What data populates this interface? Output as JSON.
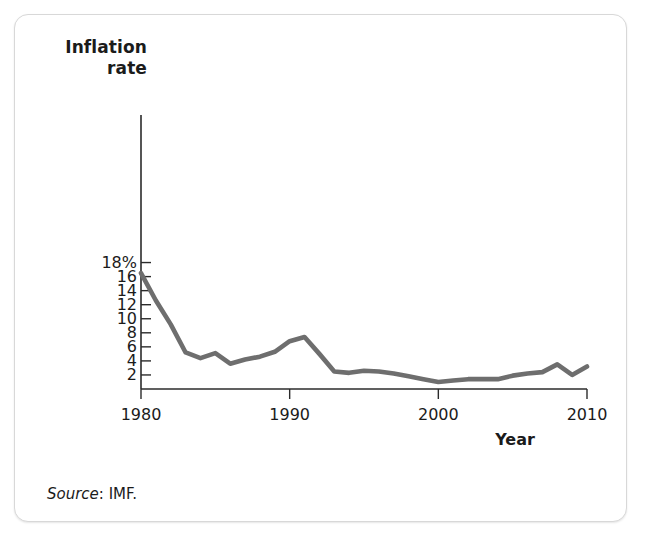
{
  "figure": {
    "source_label": "Source",
    "source_separator": ": ",
    "source_value": "IMF."
  },
  "chart_data": {
    "type": "line",
    "title": "",
    "ylabel_line1": "Inflation",
    "ylabel_line2": "rate",
    "xlabel": "Year",
    "xlim": [
      1980,
      2010
    ],
    "ylim": [
      0,
      18
    ],
    "grid": false,
    "legend": "none",
    "line_color": "#6e6e6e",
    "axis_color": "#2b2b2b",
    "y_ticks": [
      2,
      4,
      6,
      8,
      10,
      12,
      14,
      16,
      18
    ],
    "y_tick_labels": [
      "2",
      "4",
      "6",
      "8",
      "10",
      "12",
      "14",
      "16",
      "18%"
    ],
    "x_ticks": [
      1980,
      1990,
      2000,
      2010
    ],
    "x_tick_labels": [
      "1980",
      "1990",
      "2000",
      "2010"
    ],
    "series": [
      {
        "name": "Inflation rate",
        "x": [
          1980,
          1981,
          1982,
          1983,
          1984,
          1985,
          1986,
          1987,
          1988,
          1989,
          1990,
          1991,
          1992,
          1993,
          1994,
          1995,
          1996,
          1997,
          1998,
          1999,
          2000,
          2001,
          2002,
          2003,
          2004,
          2005,
          2006,
          2007,
          2008,
          2009,
          2010
        ],
        "y": [
          16.5,
          12.6,
          9.2,
          5.2,
          4.4,
          5.1,
          3.6,
          4.2,
          4.6,
          5.3,
          6.8,
          7.4,
          5.0,
          2.5,
          2.3,
          2.6,
          2.5,
          2.2,
          1.8,
          1.4,
          1.0,
          1.2,
          1.4,
          1.4,
          1.4,
          1.9,
          2.2,
          2.4,
          3.5,
          2.0,
          3.2
        ]
      }
    ]
  }
}
